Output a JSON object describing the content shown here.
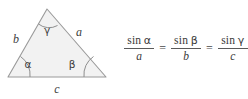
{
  "figure": {
    "kind": "law-of-sines-figure",
    "background_color": "#ffffff"
  },
  "diagram": {
    "shape": "triangle",
    "fill_color": "#f2f2f2",
    "stroke_color": "#9a9a9a",
    "vertices": {
      "apex": {
        "x": 47,
        "y": 9
      },
      "bottom_left": {
        "x": 8,
        "y": 77
      },
      "bottom_right": {
        "x": 106,
        "y": 77
      }
    },
    "side_labels": {
      "left": "b",
      "right": "a",
      "base": "c"
    },
    "angle_labels": {
      "apex": "γ",
      "bottom_left": "α",
      "bottom_right": "β"
    }
  },
  "formula": {
    "description": "Law of Sines",
    "terms": [
      {
        "numerator_fn": "sin",
        "numerator_arg": "α",
        "denominator": "a"
      },
      {
        "numerator_fn": "sin",
        "numerator_arg": "β",
        "denominator": "b"
      },
      {
        "numerator_fn": "sin",
        "numerator_arg": "γ",
        "denominator": "c"
      }
    ],
    "operators": [
      "=",
      "="
    ]
  }
}
